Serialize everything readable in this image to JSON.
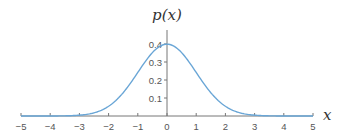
{
  "chart_data": {
    "type": "line",
    "title": "",
    "xlabel": "x",
    "ylabel": "p(x)",
    "xlim": [
      -5,
      5
    ],
    "ylim": [
      0,
      0.45
    ],
    "grid": false,
    "x_ticks": [
      -5,
      -4,
      -3,
      -2,
      -1,
      0,
      1,
      2,
      3,
      4,
      5
    ],
    "x_tick_labels": [
      "−5",
      "−4",
      "−3",
      "−2",
      "−1",
      "0",
      "1",
      "2",
      "3",
      "4",
      "5"
    ],
    "y_ticks": [
      0.1,
      0.2,
      0.3,
      0.4
    ],
    "y_tick_labels": [
      "0.1",
      "0.2",
      "0.3",
      "0.4"
    ],
    "series": [
      {
        "name": "standard normal pdf",
        "color": "#6aa6d6",
        "function": "normal_pdf",
        "mean": 0,
        "std": 1,
        "x": [
          -5,
          -4,
          -3,
          -2.5,
          -2,
          -1.5,
          -1,
          -0.5,
          0,
          0.5,
          1,
          1.5,
          2,
          2.5,
          3,
          4,
          5
        ],
        "y": [
          1.5e-06,
          0.000134,
          0.00443,
          0.0175,
          0.054,
          0.1295,
          0.242,
          0.3521,
          0.3989,
          0.3521,
          0.242,
          0.1295,
          0.054,
          0.0175,
          0.00443,
          0.000134,
          1.5e-06
        ]
      }
    ]
  }
}
